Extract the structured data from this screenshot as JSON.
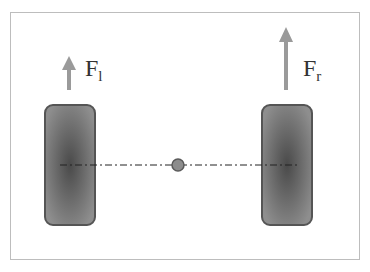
{
  "diagram": {
    "title": "",
    "forces": [
      {
        "id": "left",
        "symbol": "F",
        "subscript": "l"
      },
      {
        "id": "right",
        "symbol": "F",
        "subscript": "r"
      }
    ],
    "elements": {
      "left_wheel": "wheel",
      "right_wheel": "wheel",
      "center_point": "center of mass",
      "axle": "dash-dot axle line"
    },
    "colors": {
      "wheel_fill": "#6e6e6e",
      "wheel_border": "#4a4a4a",
      "arrow": "#9a9a9a",
      "center_dot": "#8c8c8c",
      "frame_border": "#bdbdbd"
    }
  }
}
